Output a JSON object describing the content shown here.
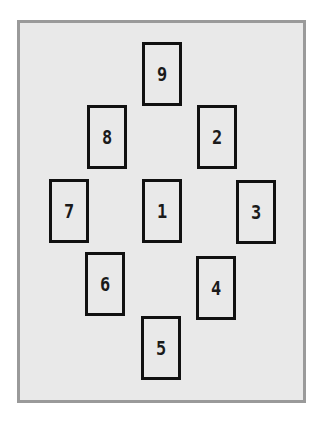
{
  "diagram": {
    "type": "card-spread-layout",
    "colors": {
      "frame_border": "#9a9a9a",
      "frame_fill": "#e9e9e9",
      "card_border": "#111111",
      "label": "#1a1a1a"
    },
    "cards": [
      {
        "label": "9",
        "x": 142,
        "y": 42
      },
      {
        "label": "8",
        "x": 87,
        "y": 105
      },
      {
        "label": "2",
        "x": 197,
        "y": 105
      },
      {
        "label": "7",
        "x": 49,
        "y": 179
      },
      {
        "label": "1",
        "x": 142,
        "y": 179
      },
      {
        "label": "3",
        "x": 236,
        "y": 180
      },
      {
        "label": "6",
        "x": 85,
        "y": 252
      },
      {
        "label": "4",
        "x": 196,
        "y": 256
      },
      {
        "label": "5",
        "x": 141,
        "y": 316
      }
    ]
  }
}
